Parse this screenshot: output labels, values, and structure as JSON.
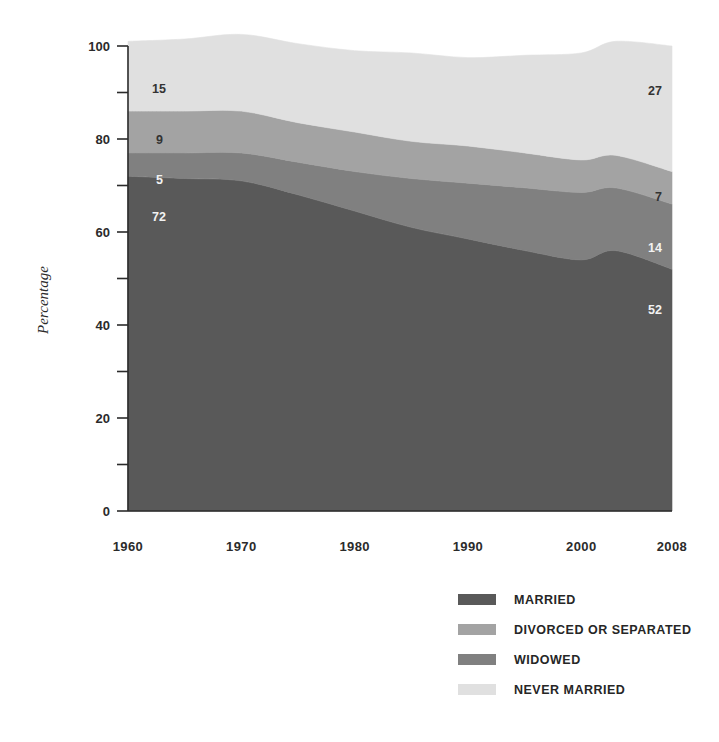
{
  "chart_data": {
    "type": "area",
    "stacked": true,
    "title": "",
    "subtitle": "",
    "xlabel": "",
    "ylabel": "Percentage",
    "xlim": [
      1960,
      2008
    ],
    "ylim": [
      0,
      100
    ],
    "grid": false,
    "legend_position": "bottom-right",
    "x": [
      1960,
      1965,
      1970,
      1975,
      1980,
      1985,
      1990,
      1995,
      2000,
      2003,
      2008
    ],
    "tick_labels_x": [
      "1960",
      "1970",
      "1980",
      "1990",
      "2000",
      "2008"
    ],
    "tick_values_y": [
      0,
      20,
      40,
      60,
      80,
      100
    ],
    "tick_labels_y": [
      "0",
      "20",
      "40",
      "60",
      "80",
      "100"
    ],
    "minor_tick_values_y": [
      10,
      30,
      50,
      70,
      90
    ],
    "series": [
      {
        "name": "MARRIED",
        "color": "#595959",
        "label_color": "#f2f2f2",
        "values": [
          72,
          71.5,
          71,
          68,
          64.5,
          61,
          58.5,
          56,
          54,
          56,
          52
        ],
        "endpoint_labels": {
          "start": "72",
          "end": "52"
        }
      },
      {
        "name": "WIDOWED",
        "color": "#808080",
        "label_color": "#f2f2f2",
        "values": [
          5,
          5.5,
          6,
          7,
          8.5,
          10.5,
          12,
          13.5,
          14.5,
          13.5,
          14
        ],
        "endpoint_labels": {
          "start": "5",
          "end": "14"
        }
      },
      {
        "name": "DIVORCED OR SEPARATED",
        "color": "#a3a3a3",
        "label_color": "#333333",
        "values": [
          9,
          9,
          9,
          8.5,
          8.5,
          8,
          8,
          7.5,
          7,
          7,
          7
        ],
        "endpoint_labels": {
          "start": "9",
          "end": "7"
        }
      },
      {
        "name": "NEVER MARRIED",
        "color": "#e0e0e0",
        "label_color": "#333333",
        "values": [
          15,
          15.5,
          16.5,
          17,
          17.5,
          19,
          19,
          21,
          23,
          24.5,
          27
        ],
        "endpoint_labels": {
          "start": "15",
          "end": "27"
        }
      }
    ],
    "series_order_bottom_to_top": [
      "MARRIED",
      "WIDOWED",
      "DIVORCED OR SEPARATED",
      "NEVER MARRIED"
    ]
  },
  "axes": {
    "y_label": "Percentage",
    "y_ticks": [
      "100",
      "80",
      "60",
      "40",
      "20",
      "0"
    ],
    "x_ticks": [
      "1960",
      "1970",
      "1980",
      "1990",
      "2000",
      "2008"
    ]
  },
  "annotations": {
    "left": {
      "never_married": "15",
      "divorced_or_separated": "9",
      "widowed": "5",
      "married": "72"
    },
    "right": {
      "never_married": "27",
      "divorced_or_separated": "7",
      "widowed": "14",
      "married": "52"
    }
  },
  "legend": {
    "items": [
      {
        "label": "MARRIED",
        "color": "#595959"
      },
      {
        "label": "DIVORCED OR SEPARATED",
        "color": "#a3a3a3"
      },
      {
        "label": "WIDOWED",
        "color": "#808080"
      },
      {
        "label": "NEVER MARRIED",
        "color": "#e0e0e0"
      }
    ]
  }
}
